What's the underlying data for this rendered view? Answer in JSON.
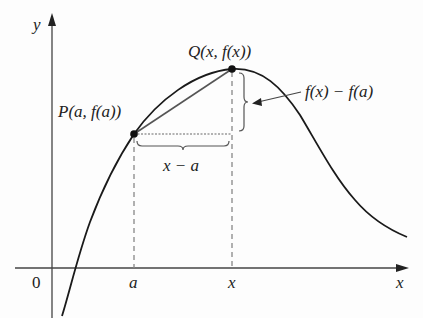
{
  "diagram": {
    "type": "secant-line-on-curve",
    "axes": {
      "x_label": "x",
      "y_label": "y",
      "origin_label": "0"
    },
    "points": {
      "P": {
        "name": "P",
        "coords": "(a, f(a))"
      },
      "Q": {
        "name": "Q",
        "coords": "(x, f(x))"
      }
    },
    "tick_labels": {
      "a": "a",
      "x": "x"
    },
    "annotations": {
      "horizontal_difference": "x − a",
      "vertical_difference": "f(x) − f(a)"
    },
    "colors": {
      "curve": "#1a1a1a",
      "secant": "#555555",
      "guides": "#888888",
      "text": "#222222"
    }
  }
}
